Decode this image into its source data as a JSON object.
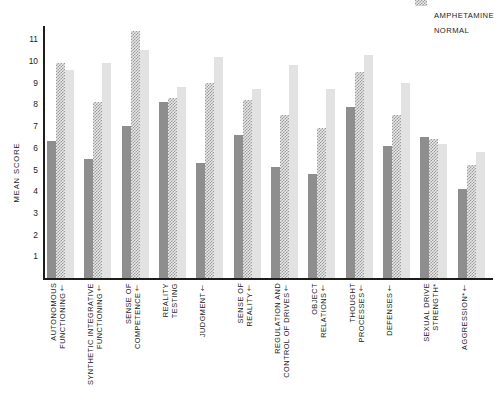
{
  "chart_data": {
    "type": "bar",
    "title": "",
    "xlabel": "",
    "ylabel": "MEAN SCORE",
    "ylim": [
      0,
      11.8
    ],
    "yticks": [
      1,
      2,
      3,
      4,
      5,
      6,
      7,
      8,
      9,
      10,
      11
    ],
    "grid": false,
    "legend_position": "top-right",
    "categories": [
      "AUTONOMOUS\nFUNCTIONING†",
      "SYNTHETIC INTEGRATIVE\nFUNCTIONING†",
      "SENSE OF\nCOMPETENCE†",
      "REALITY\nTESTING",
      "JUDGMENT†",
      "SENSE OF\nREALITY†",
      "REGULATION AND\nCONTROL OF DRIVES†",
      "OBJECT\nRELATIONS†",
      "THOUGHT\nPROCESSES†",
      "DEFENSES†",
      "SEXUAL DRIVE\nSTRENGTH*",
      "AGGRESSION*†"
    ],
    "series": [
      {
        "name": "",
        "swatch_style": "solid-dark",
        "color": "#8e8e8e",
        "values": [
          6.3,
          5.5,
          7.0,
          8.1,
          5.3,
          6.6,
          5.1,
          4.8,
          7.9,
          6.1,
          6.5,
          4.1
        ]
      },
      {
        "name": "AMPHETAMINE",
        "swatch_style": "checkered",
        "color": "#9a9a9a",
        "values": [
          9.9,
          8.1,
          11.4,
          8.3,
          9.0,
          8.2,
          7.5,
          6.9,
          9.5,
          7.5,
          6.4,
          5.2
        ]
      },
      {
        "name": "NORMAL",
        "swatch_style": "solid-light",
        "color": "#e2e2e2",
        "values": [
          9.6,
          9.9,
          10.5,
          8.8,
          10.2,
          8.7,
          9.8,
          8.7,
          10.3,
          9.0,
          6.2,
          5.8
        ]
      }
    ]
  },
  "axis": {
    "y_title": "MEAN SCORE"
  },
  "legend": {
    "items": [
      {
        "label": ""
      },
      {
        "label": "AMPHETAMINE"
      },
      {
        "label": "NORMAL"
      }
    ]
  }
}
